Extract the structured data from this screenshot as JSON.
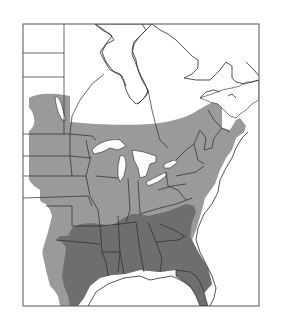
{
  "figure": {
    "type": "range-map",
    "region": "Eastern North America",
    "frame": {
      "x": 23,
      "y": 24,
      "width": 236,
      "height": 282
    },
    "colors": {
      "background": "#ffffff",
      "water": "#ffffff",
      "outside_range_land": "#ffffff",
      "range_light": "#9a9a9a",
      "range_dark": "#6e6e6e",
      "border": "#2a2a2a",
      "frame": "#555555"
    },
    "legend": {
      "zones": [
        {
          "name": "range-light",
          "shade": "light gray"
        },
        {
          "name": "range-dark",
          "shade": "dark gray"
        }
      ]
    }
  }
}
